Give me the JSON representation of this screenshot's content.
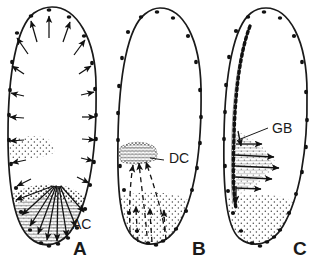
{
  "figure": {
    "background_color": "#ffffff",
    "ink_color": "#1a1a1a",
    "stipple_color": "#555555",
    "width": 323,
    "height": 269
  },
  "panels": [
    {
      "id": "A",
      "letter": "A",
      "letter_x": 73,
      "letter_y": 255,
      "egg": {
        "cx": 52,
        "cy": 126,
        "rx": 44,
        "ry": 119,
        "tilt": -4
      },
      "labels": [
        {
          "text": "AC",
          "x": 72,
          "y": 229,
          "name": "label-ac"
        }
      ],
      "nuclei_count": 26,
      "arrow_style": "solid",
      "arrow_direction": "outward-radial",
      "arrow_count": 26,
      "stipple_regions": [
        "posterior-cap",
        "left-mid-wedge"
      ],
      "description": "Radial arrows from interior to cortex; stippled posterior activation centre"
    },
    {
      "id": "B",
      "letter": "B",
      "letter_x": 192,
      "letter_y": 255,
      "egg": {
        "cx": 159,
        "cy": 126,
        "rx": 42,
        "ry": 118,
        "tilt": -3
      },
      "labels": [
        {
          "text": "DC",
          "x": 169,
          "y": 163,
          "name": "label-dc"
        }
      ],
      "nuclei_count": 24,
      "arrow_style": "dashed",
      "arrow_direction": "posterior-to-differentiation-centre",
      "arrow_count": 6,
      "stipple_regions": [
        "posterior-pool",
        "differentiation-centre"
      ],
      "description": "Dashed arrows converging from posterior pole plasm into the differentiation centre"
    },
    {
      "id": "C",
      "letter": "C",
      "letter_x": 293,
      "letter_y": 255,
      "egg": {
        "cx": 265,
        "cy": 126,
        "rx": 43,
        "ry": 117,
        "tilt": -2
      },
      "labels": [
        {
          "text": "GB",
          "x": 272,
          "y": 133,
          "name": "label-gb"
        }
      ],
      "nuclei_count": 26,
      "arrow_style": "solid",
      "arrow_direction": "lateral-from-germ-band",
      "arrow_count": 8,
      "stipple_regions": [
        "posterior-pool",
        "lateral-plume"
      ],
      "description": "Dense dotted germ band along ventral edge with arrows radiating laterally"
    }
  ]
}
